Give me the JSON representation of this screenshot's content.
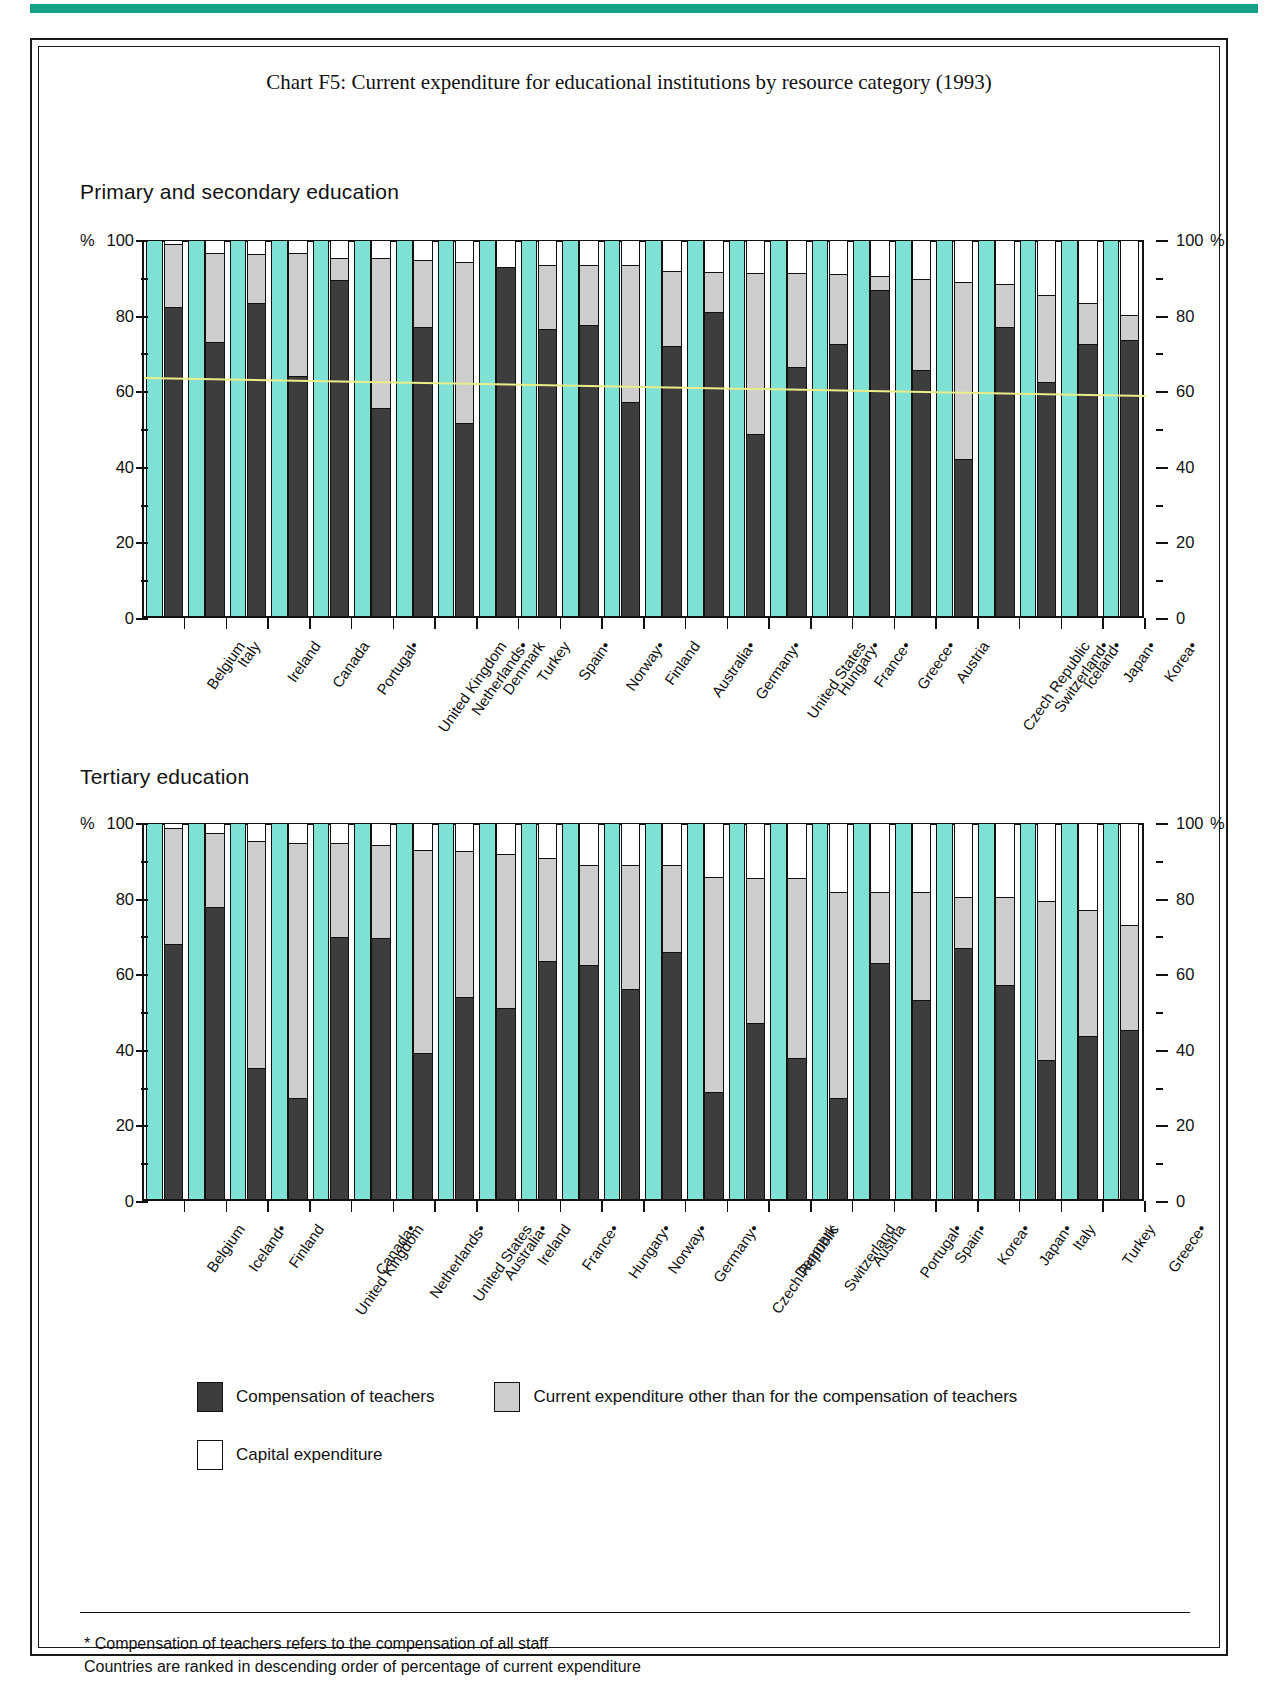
{
  "page": {
    "title": "Chart F5: Current expenditure for educational institutions by resource category (1993)"
  },
  "legend": {
    "compensation_label": "Compensation of teachers",
    "other_label": "Current expenditure other than for the compensation of teachers",
    "capital_label": "Capital expenditure"
  },
  "footnotes": {
    "line1": "* Compensation of teachers refers to the compensation of all staff",
    "line2": "Countries are ranked in descending order of percentage of current expenditure"
  },
  "axis": {
    "unit_left": "%",
    "unit_right": "%",
    "ticks": [
      "100",
      "80",
      "60",
      "40",
      "20",
      "0"
    ]
  },
  "colors": {
    "background_bar": "#7fe0d4",
    "compensation": "#3d3d3d",
    "other_current": "#cdcdcd",
    "capital": "#ffffff",
    "trendline": "#e9ee86",
    "rule": "#16a085"
  },
  "panels": [
    {
      "key": "primary",
      "title": "Primary and secondary education"
    },
    {
      "key": "tertiary",
      "title": "Tertiary education"
    }
  ],
  "chart_data": [
    {
      "type": "bar",
      "subtype": "stacked-percentage",
      "title": "Primary and secondary education",
      "xlabel": "",
      "ylabel": "%",
      "ylim": [
        0,
        100
      ],
      "yticks": [
        0,
        20,
        40,
        60,
        80,
        100
      ],
      "grid": false,
      "legend": "bottom",
      "annotation": "Pale yellow trend line shows compensation of teachers trend, declining from about 70% to about 60%",
      "categories": [
        "Belgium",
        "Italy",
        "Ireland",
        "Canada",
        "Portugal*",
        "United Kingdom",
        "Netherlands*",
        "Denmark",
        "Turkey",
        "Spain*",
        "Norway*",
        "Finland",
        "Australia*",
        "Germany*",
        "United States",
        "Hungary*",
        "France*",
        "Greece*",
        "Austria",
        "Czech Republic",
        "Switzerland*",
        "Iceland*",
        "Japan*",
        "Korea*"
      ],
      "series": [
        {
          "name": "Compensation of teachers",
          "color": "#3d3d3d",
          "values": [
            82.5,
            73,
            83.5,
            64,
            89.5,
            55.5,
            77,
            51.5,
            93,
            76.5,
            77.5,
            57,
            72,
            81,
            48.5,
            66.5,
            72.5,
            87,
            65.5,
            42,
            77,
            62.5,
            72.5,
            73.5
          ]
        },
        {
          "name": "Current expenditure other than for the compensation of teachers",
          "color": "#cdcdcd",
          "values": [
            16.7,
            23.7,
            13,
            32.8,
            6.1,
            40,
            18,
            43,
            0,
            17,
            16,
            36.7,
            20,
            10.7,
            43,
            25,
            18.7,
            3.8,
            24.5,
            47,
            11.5,
            23,
            11,
            6.7
          ]
        },
        {
          "name": "Capital expenditure",
          "color": "#ffffff",
          "values": [
            0.8,
            3.3,
            3.5,
            3.2,
            4.4,
            4.5,
            5,
            5.5,
            7,
            6.5,
            6.5,
            6.3,
            8,
            8.3,
            8.5,
            8.5,
            8.8,
            9.2,
            10,
            11,
            11.5,
            14.5,
            16.5,
            19.8
          ]
        }
      ]
    },
    {
      "type": "bar",
      "subtype": "stacked-percentage",
      "title": "Tertiary education",
      "xlabel": "",
      "ylabel": "%",
      "ylim": [
        0,
        100
      ],
      "yticks": [
        0,
        20,
        40,
        60,
        80,
        100
      ],
      "grid": false,
      "legend": "bottom",
      "categories": [
        "Belgium",
        "Iceland*",
        "Finland",
        "United Kingdom",
        "Canada*",
        "Netherlands*",
        "United States",
        "Australia*",
        "Ireland",
        "France*",
        "Hungary*",
        "Norway*",
        "Germany*",
        "Czech Republic",
        "Denmark",
        "Switzerland",
        "Austria",
        "Portugal*",
        "Spain*",
        "Korea*",
        "Japan*",
        "Italy",
        "Turkey",
        "Greece*"
      ],
      "series": [
        {
          "name": "Compensation of teachers",
          "color": "#3d3d3d",
          "values": [
            68,
            78,
            35,
            27,
            70,
            69.5,
            39,
            54,
            51,
            63.5,
            62.5,
            56,
            66,
            28.5,
            47,
            37.5,
            27,
            63,
            53,
            67,
            57,
            37,
            43.5,
            45
          ]
        },
        {
          "name": "Current expenditure other than for the compensation of teachers",
          "color": "#cdcdcd",
          "values": [
            31,
            19.5,
            60.5,
            68,
            25,
            25,
            54,
            38.7,
            41,
            27.5,
            26.5,
            33,
            23,
            57.5,
            38.5,
            48,
            55,
            19,
            29,
            13.5,
            23.5,
            42.5,
            33.5,
            28
          ]
        },
        {
          "name": "Capital expenditure",
          "color": "#ffffff",
          "values": [
            1,
            2.5,
            4.5,
            5,
            5,
            5.5,
            7,
            7.3,
            8,
            9,
            11,
            11,
            11,
            14,
            14.5,
            14.5,
            18,
            18,
            18,
            19.5,
            19.5,
            20.5,
            23,
            27
          ]
        }
      ]
    }
  ]
}
